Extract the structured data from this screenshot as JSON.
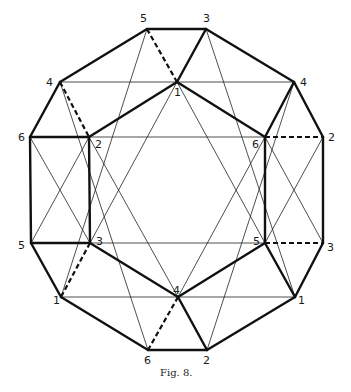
{
  "figure": {
    "caption": "Fig. 8.",
    "stroke_color": "#111111",
    "background": "#ffffff"
  },
  "vertices": {
    "top5": {
      "label": "5",
      "x": 147,
      "y": 29,
      "lx": 140,
      "ly": 22
    },
    "top3": {
      "label": "3",
      "x": 206,
      "y": 29,
      "lx": 203,
      "ly": 22
    },
    "l4": {
      "label": "4",
      "x": 60,
      "y": 82,
      "lx": 46,
      "ly": 86
    },
    "r4": {
      "label": "4",
      "x": 294,
      "y": 82,
      "lx": 300,
      "ly": 86
    },
    "c1": {
      "label": "1",
      "x": 177,
      "y": 82,
      "lx": 174,
      "ly": 96
    },
    "l6": {
      "label": "6",
      "x": 30,
      "y": 137,
      "lx": 18,
      "ly": 141
    },
    "i2": {
      "label": "2",
      "x": 89,
      "y": 137,
      "lx": 95,
      "ly": 148
    },
    "i6": {
      "label": "6",
      "x": 265,
      "y": 137,
      "lx": 252,
      "ly": 148
    },
    "r2": {
      "label": "2",
      "x": 323,
      "y": 137,
      "lx": 328,
      "ly": 141
    },
    "l5": {
      "label": "5",
      "x": 31,
      "y": 243,
      "lx": 18,
      "ly": 249
    },
    "i3": {
      "label": "3",
      "x": 90,
      "y": 243,
      "lx": 96,
      "ly": 245
    },
    "i5": {
      "label": "5",
      "x": 265,
      "y": 243,
      "lx": 253,
      "ly": 245
    },
    "r3": {
      "label": "3",
      "x": 323,
      "y": 243,
      "lx": 327,
      "ly": 251
    },
    "l1": {
      "label": "1",
      "x": 61,
      "y": 297,
      "lx": 53,
      "ly": 304
    },
    "c4": {
      "label": "4",
      "x": 178,
      "y": 297,
      "lx": 173,
      "ly": 294
    },
    "r1": {
      "label": "1",
      "x": 295,
      "y": 297,
      "lx": 298,
      "ly": 304
    },
    "b6": {
      "label": "6",
      "x": 148,
      "y": 350,
      "lx": 144,
      "ly": 364
    },
    "b2": {
      "label": "2",
      "x": 207,
      "y": 350,
      "lx": 203,
      "ly": 364
    }
  },
  "edges": {
    "thick": [
      [
        "top5",
        "top3"
      ],
      [
        "top3",
        "r4"
      ],
      [
        "r4",
        "r2"
      ],
      [
        "r2",
        "r3"
      ],
      [
        "r3",
        "r1"
      ],
      [
        "r1",
        "b2"
      ],
      [
        "b2",
        "b6"
      ],
      [
        "b6",
        "l1"
      ],
      [
        "l1",
        "l5"
      ],
      [
        "l5",
        "l6"
      ],
      [
        "l6",
        "l4"
      ],
      [
        "l4",
        "top5"
      ],
      [
        "top3",
        "c1"
      ],
      [
        "c1",
        "i2"
      ],
      [
        "c1",
        "i6"
      ],
      [
        "i6",
        "r4"
      ],
      [
        "l6",
        "i2"
      ],
      [
        "i2",
        "i3"
      ],
      [
        "l5",
        "i3"
      ],
      [
        "i6",
        "i5"
      ],
      [
        "i3",
        "c4"
      ],
      [
        "i5",
        "c4"
      ],
      [
        "c4",
        "b2"
      ],
      [
        "i5",
        "r1"
      ]
    ],
    "dashed": [
      [
        "top5",
        "c1"
      ],
      [
        "l4",
        "i2"
      ],
      [
        "i6",
        "r2"
      ],
      [
        "i5",
        "r3"
      ],
      [
        "i3",
        "l1"
      ],
      [
        "c4",
        "b6"
      ]
    ],
    "thin": [
      [
        "l4",
        "r4"
      ],
      [
        "i2",
        "i6"
      ],
      [
        "i3",
        "i5"
      ],
      [
        "l1",
        "r1"
      ],
      [
        "c1",
        "i3"
      ],
      [
        "c1",
        "i5"
      ],
      [
        "c4",
        "i2"
      ],
      [
        "c4",
        "i6"
      ],
      [
        "top5",
        "l1"
      ],
      [
        "top3",
        "r1"
      ],
      [
        "l4",
        "b6"
      ],
      [
        "r4",
        "b2"
      ],
      [
        "l6",
        "i3"
      ],
      [
        "l5",
        "i2"
      ],
      [
        "i6",
        "r3"
      ],
      [
        "i5",
        "r2"
      ]
    ]
  }
}
